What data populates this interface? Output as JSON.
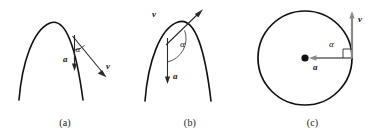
{
  "figure": {
    "background_color": "#ffffff",
    "curve_color": "#111111",
    "arrow_dark_color": "#2a2a2a",
    "arrow_gray_color": "#8a8a8a",
    "width": 377,
    "height": 133
  },
  "panels": [
    {
      "id": "a",
      "caption": "(a)",
      "shape": "parabola",
      "description": "projectile trajectory near apex, descending branch",
      "labels": {
        "acceleration": "a",
        "velocity": "v",
        "angle": "α"
      },
      "angle_between_a_and_v": "obtuse",
      "velocity_direction": "down-right (tangent on descending branch)",
      "acceleration_direction": "straight down"
    },
    {
      "id": "b",
      "caption": "(b)",
      "shape": "parabola",
      "description": "projectile trajectory near apex, ascending branch",
      "labels": {
        "acceleration": "a",
        "velocity": "v",
        "angle": "α"
      },
      "angle_between_a_and_v": "obtuse",
      "velocity_direction": "up-right (tangent on ascending branch)",
      "acceleration_direction": "straight down"
    },
    {
      "id": "c",
      "caption": "(c)",
      "shape": "circle",
      "description": "uniform circular motion, centripetal acceleration toward center",
      "labels": {
        "acceleration": "a",
        "velocity": "v",
        "angle": "α"
      },
      "angle_between_a_and_v": "90° (right angle mark)",
      "velocity_direction": "straight up (tangent at right of circle)",
      "acceleration_direction": "left, toward center"
    }
  ]
}
